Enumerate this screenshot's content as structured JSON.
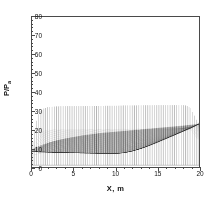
{
  "chart_data": {
    "type": "line",
    "title": "",
    "xlabel": "X, m",
    "ylabel_text": "P/P",
    "ylabel_sub": "a",
    "xlim": [
      0,
      20
    ],
    "ylim": [
      0,
      80
    ],
    "xticks": [
      0,
      5,
      10,
      15,
      20
    ],
    "yticks": [
      0,
      10,
      20,
      30,
      40,
      50,
      60,
      70,
      80
    ],
    "x_minor_step": 1,
    "y_minor_step": 2,
    "grid": false,
    "legend": null,
    "line_color": "#3c3c3c",
    "frame_color": "#4a4a4a",
    "n_vertical_lines": 92,
    "baseline_value": 1.0,
    "series": [
      {
        "name": "upper envelope",
        "x": [
          0.0,
          0.25,
          0.5,
          0.75,
          1.0,
          1.5,
          2.0,
          2.5,
          3.0,
          4.0,
          5.0,
          6.0,
          7.0,
          8.0,
          9.0,
          10.0,
          11.0,
          12.0,
          13.0,
          14.0,
          15.0,
          16.0,
          17.0,
          18.0,
          18.5,
          19.0,
          19.4,
          19.7,
          20.0
        ],
        "values": [
          10.0,
          18.0,
          24.0,
          28.0,
          30.0,
          31.4,
          32.0,
          32.2,
          32.3,
          32.4,
          32.5,
          32.5,
          32.6,
          32.6,
          32.7,
          32.7,
          32.8,
          32.8,
          32.9,
          32.9,
          33.0,
          33.0,
          33.0,
          33.0,
          32.8,
          31.5,
          28.0,
          25.0,
          23.0
        ]
      },
      {
        "name": "lower envelope",
        "x": [
          0.0,
          0.5,
          1.0,
          1.5,
          2.0,
          3.0,
          4.0,
          5.0,
          6.0,
          7.0,
          8.0,
          9.0,
          10.0,
          11.0,
          12.0,
          13.0,
          14.0,
          15.0,
          16.0,
          17.0,
          18.0,
          19.0,
          19.5,
          20.0
        ],
        "values": [
          8.2,
          8.1,
          8.0,
          8.0,
          7.9,
          7.8,
          7.7,
          7.6,
          7.5,
          7.4,
          7.3,
          7.2,
          7.2,
          7.6,
          8.5,
          9.8,
          11.4,
          13.2,
          15.1,
          17.0,
          18.9,
          20.8,
          21.9,
          23.0
        ]
      },
      {
        "name": "dark core band upper",
        "x": [
          0.0,
          1.0,
          2.0,
          3.0,
          4.0,
          5.0,
          6.0,
          7.0,
          8.0,
          9.0,
          10.0,
          11.0,
          12.0,
          13.0,
          14.0,
          15.0,
          16.0,
          17.0,
          18.0,
          19.0,
          20.0
        ],
        "values": [
          9.5,
          11.5,
          13.0,
          14.2,
          15.2,
          16.0,
          16.8,
          17.4,
          18.0,
          18.4,
          18.8,
          19.2,
          19.6,
          20.0,
          20.4,
          20.8,
          21.2,
          21.6,
          22.0,
          22.5,
          23.0
        ]
      }
    ]
  },
  "axes": {
    "x_tick_labels": [
      "0",
      "5",
      "10",
      "15",
      "20"
    ],
    "y_tick_labels": [
      "0",
      "10",
      "20",
      "30",
      "40",
      "50",
      "60",
      "70",
      "80"
    ]
  }
}
